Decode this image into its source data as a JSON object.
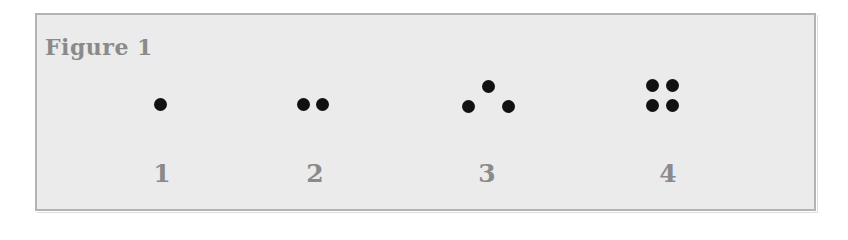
{
  "figure": {
    "title": "Figure 1",
    "dot_color": "#111111",
    "groups": [
      {
        "label": "1",
        "count": 1,
        "arrangement": "single"
      },
      {
        "label": "2",
        "count": 2,
        "arrangement": "horizontal pair"
      },
      {
        "label": "3",
        "count": 3,
        "arrangement": "triangle"
      },
      {
        "label": "4",
        "count": 4,
        "arrangement": "2x2 square"
      }
    ]
  }
}
